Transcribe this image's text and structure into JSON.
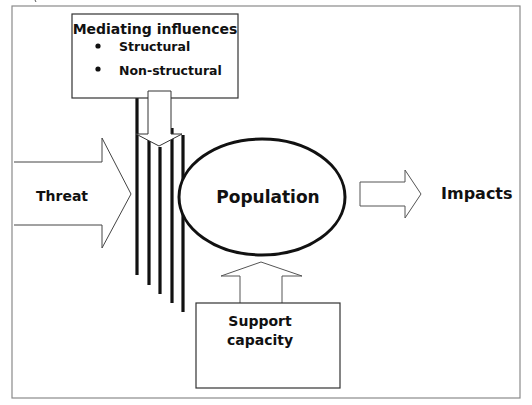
{
  "diagram": {
    "mediating_box": {
      "title": "Mediating influences",
      "items": [
        "Structural",
        "Non-structural"
      ]
    },
    "threat_label": "Threat",
    "population_label": "Population",
    "impacts_label": "Impacts",
    "support_box": {
      "line1": "Support",
      "line2": "capacity"
    },
    "colors": {
      "stroke": "#111111",
      "frame": "#8a8a8a",
      "fill": "#ffffff"
    }
  }
}
